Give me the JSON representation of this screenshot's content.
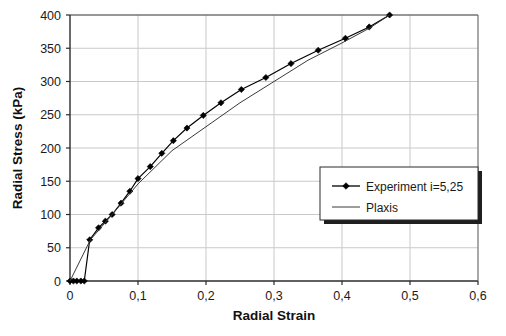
{
  "chart_data": {
    "type": "line",
    "title": "",
    "xlabel": "Radial Strain",
    "ylabel": "Radial Stress (kPa)",
    "xlim": [
      0,
      0.6
    ],
    "ylim": [
      0,
      400
    ],
    "xticks": [
      "0",
      "0,1",
      "0,2",
      "0,3",
      "0,4",
      "0,5",
      "0,6"
    ],
    "xtick_values": [
      0,
      0.1,
      0.2,
      0.3,
      0.4,
      0.5,
      0.6
    ],
    "yticks": [
      "0",
      "50",
      "100",
      "150",
      "200",
      "250",
      "300",
      "350",
      "400"
    ],
    "ytick_values": [
      0,
      50,
      100,
      150,
      200,
      250,
      300,
      350,
      400
    ],
    "grid": true,
    "grid_color": "#c9c9c9",
    "legend_position": "center-right",
    "series": [
      {
        "name": "Experiment i=5,25",
        "marker": "diamond",
        "color": "#000000",
        "points": [
          [
            0.0,
            0
          ],
          [
            0.005,
            0
          ],
          [
            0.01,
            0
          ],
          [
            0.016,
            0
          ],
          [
            0.021,
            0
          ],
          [
            0.029,
            62
          ],
          [
            0.042,
            80
          ],
          [
            0.052,
            90
          ],
          [
            0.062,
            100
          ],
          [
            0.075,
            117
          ],
          [
            0.088,
            135
          ],
          [
            0.1,
            154
          ],
          [
            0.118,
            172
          ],
          [
            0.135,
            192
          ],
          [
            0.152,
            211
          ],
          [
            0.172,
            230
          ],
          [
            0.196,
            249
          ],
          [
            0.222,
            268
          ],
          [
            0.252,
            288
          ],
          [
            0.288,
            306
          ],
          [
            0.325,
            327
          ],
          [
            0.365,
            347
          ],
          [
            0.405,
            365
          ],
          [
            0.44,
            382
          ],
          [
            0.47,
            400
          ]
        ]
      },
      {
        "name": "Plaxis",
        "marker": "none",
        "color": "#3a3a3a",
        "points": [
          [
            0.0,
            0
          ],
          [
            0.03,
            62
          ],
          [
            0.062,
            100
          ],
          [
            0.1,
            146
          ],
          [
            0.15,
            196
          ],
          [
            0.2,
            232
          ],
          [
            0.25,
            268
          ],
          [
            0.3,
            300
          ],
          [
            0.35,
            332
          ],
          [
            0.4,
            358
          ],
          [
            0.44,
            380
          ],
          [
            0.47,
            400
          ]
        ]
      }
    ]
  },
  "legend": {
    "entries": [
      {
        "label": "Experiment i=5,25"
      },
      {
        "label": "Plaxis"
      }
    ]
  }
}
